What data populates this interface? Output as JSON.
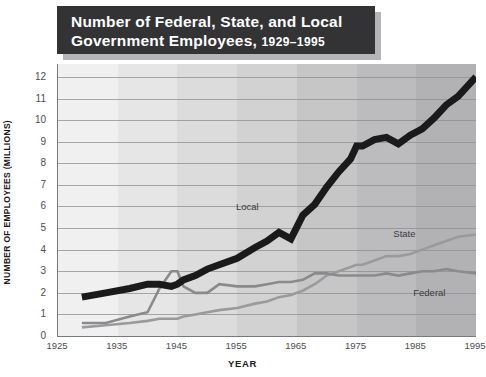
{
  "title": {
    "line1": "Number of Federal, State, and Local",
    "line2": "Government Employees,",
    "years": "1929–1995"
  },
  "axes": {
    "x_title": "YEAR",
    "y_title": "NUMBER OF EMPLOYEES (MILLIONS)",
    "x_ticks": [
      "1925",
      "1935",
      "1945",
      "1955",
      "1965",
      "1975",
      "1985",
      "1995"
    ],
    "y_ticks": [
      "0",
      "1",
      "2",
      "3",
      "4",
      "5",
      "6",
      "7",
      "8",
      "9",
      "10",
      "11",
      "12"
    ]
  },
  "annotations": {
    "local": "Local",
    "state": "State",
    "federal": "Federal"
  },
  "colors": {
    "local_line": "#1a1a1a",
    "state_line": "#9a9a9c",
    "federal_line": "#8a8a8c",
    "banner_bg": "#333335",
    "banner_text": "#ffffff",
    "gridline": "#8e8e90",
    "axis": "#7a7a7c",
    "page_bg": "#ffffff"
  },
  "chart_data": {
    "type": "line",
    "title": "Number of Federal, State, and Local Government Employees, 1929–1995",
    "xlabel": "YEAR",
    "ylabel": "NUMBER OF EMPLOYEES (MILLIONS)",
    "xlim": [
      1925,
      1995
    ],
    "ylim": [
      0,
      12.6
    ],
    "grid": true,
    "legend": "inline-annotations",
    "x": [
      1929,
      1933,
      1937,
      1940,
      1942,
      1944,
      1945,
      1946,
      1948,
      1950,
      1952,
      1955,
      1958,
      1960,
      1962,
      1964,
      1966,
      1968,
      1970,
      1972,
      1974,
      1975,
      1976,
      1978,
      1980,
      1982,
      1984,
      1986,
      1988,
      1990,
      1992,
      1995
    ],
    "series": [
      {
        "name": "Local",
        "color": "#1a1a1a",
        "width": "thick",
        "values": [
          1.8,
          2.0,
          2.2,
          2.4,
          2.4,
          2.3,
          2.4,
          2.6,
          2.8,
          3.1,
          3.3,
          3.6,
          4.1,
          4.4,
          4.8,
          4.5,
          5.6,
          6.1,
          6.9,
          7.6,
          8.2,
          8.8,
          8.8,
          9.1,
          9.2,
          8.9,
          9.3,
          9.6,
          10.1,
          10.7,
          11.1,
          12.0
        ]
      },
      {
        "name": "State",
        "color": "#9a9a9c",
        "width": "medium",
        "values": [
          0.4,
          0.5,
          0.6,
          0.7,
          0.8,
          0.8,
          0.8,
          0.9,
          1.0,
          1.1,
          1.2,
          1.3,
          1.5,
          1.6,
          1.8,
          1.9,
          2.1,
          2.4,
          2.8,
          3.0,
          3.2,
          3.3,
          3.3,
          3.5,
          3.7,
          3.7,
          3.8,
          4.0,
          4.2,
          4.4,
          4.6,
          4.7
        ]
      },
      {
        "name": "Federal",
        "color": "#8a8a8c",
        "width": "medium",
        "values": [
          0.6,
          0.6,
          0.9,
          1.1,
          2.2,
          3.0,
          3.0,
          2.3,
          2.0,
          2.0,
          2.4,
          2.3,
          2.3,
          2.4,
          2.5,
          2.5,
          2.6,
          2.9,
          2.9,
          2.8,
          2.8,
          2.8,
          2.8,
          2.8,
          2.9,
          2.8,
          2.9,
          3.0,
          3.0,
          3.1,
          3.0,
          2.9
        ]
      }
    ]
  }
}
